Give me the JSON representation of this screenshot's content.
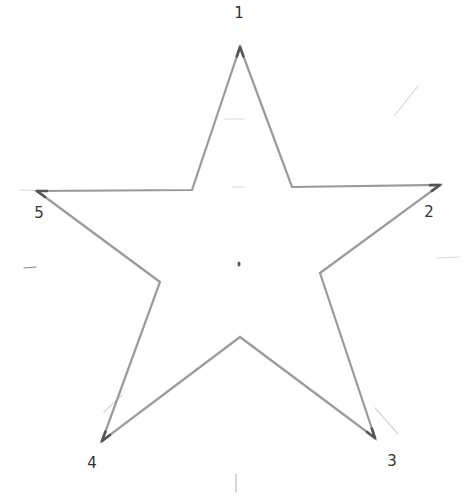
{
  "diagram": {
    "type": "hand-drawn pentagram (five-pointed star)",
    "stroke_color": "#9a9a9a",
    "tip_color": "#555555",
    "faint_color": "#d4d4d4",
    "center": {
      "x": 239,
      "y": 264
    },
    "outer_vertices": [
      {
        "id": "1",
        "x": 240,
        "y": 47
      },
      {
        "id": "2",
        "x": 440,
        "y": 185
      },
      {
        "id": "3",
        "x": 375,
        "y": 438
      },
      {
        "id": "4",
        "x": 102,
        "y": 441
      },
      {
        "id": "5",
        "x": 37,
        "y": 191
      }
    ],
    "inner_vertices": [
      {
        "x": 292,
        "y": 187
      },
      {
        "x": 320,
        "y": 273
      },
      {
        "x": 240,
        "y": 337
      },
      {
        "x": 160,
        "y": 282
      },
      {
        "x": 192,
        "y": 190
      }
    ],
    "labels": [
      {
        "id": "label-1",
        "text": "1",
        "x": 239,
        "y": 13
      },
      {
        "id": "label-2",
        "text": "2",
        "x": 429,
        "y": 212
      },
      {
        "id": "label-3",
        "text": "3",
        "x": 392,
        "y": 461
      },
      {
        "id": "label-4",
        "text": "4",
        "x": 92,
        "y": 463
      },
      {
        "id": "label-5",
        "text": "5",
        "x": 39,
        "y": 213
      }
    ]
  }
}
